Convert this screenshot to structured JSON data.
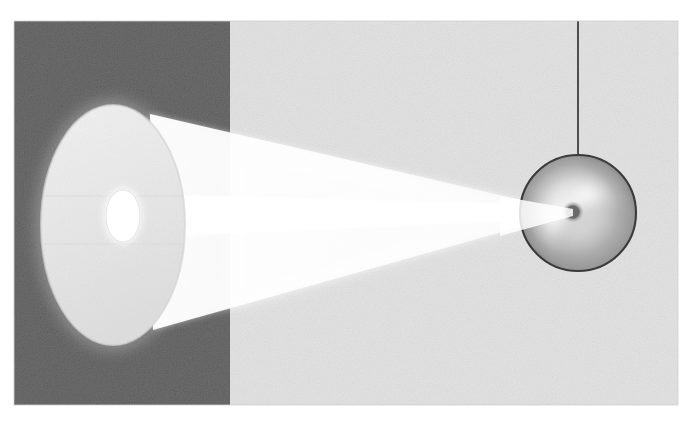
{
  "figure": {
    "medium": "halftone printed illustration, grayscale",
    "canvas": {
      "width": 693,
      "height": 421
    },
    "content_box": {
      "x": 14,
      "y": 21,
      "width": 664,
      "height": 384
    }
  },
  "palette": {
    "page_background": "#ffffff",
    "dark_panel": "#6e6e6e",
    "light_panel": "#e3e3e3",
    "beam_light": "#fbfbfb",
    "beam_inner": "#ffffff",
    "lens_face": "#ededed",
    "source_highlight": "#ffffff",
    "sphere_outline": "#3a3a3a",
    "sphere_shadow": "#9a9a9a",
    "sphere_glow": "#ffffff",
    "focal_spot": "#6a6a6a",
    "string": "#2b2b2b"
  },
  "regions": {
    "dark_panel": {
      "label": "dark background panel",
      "x": 14,
      "y": 21,
      "width": 216,
      "height": 384,
      "fill": "#6e6e6e"
    },
    "light_panel": {
      "label": "light background panel",
      "x": 230,
      "y": 21,
      "width": 448,
      "height": 384,
      "fill": "#e3e3e3"
    }
  },
  "elements": {
    "reflector": {
      "label": "reflector / lens face ellipse",
      "cx": 113,
      "cy": 225,
      "rx": 72,
      "ry": 120,
      "fill": "#ededed"
    },
    "light_source": {
      "label": "lamp filament highlight",
      "cx": 123,
      "cy": 216,
      "rx": 17,
      "ry": 26,
      "fill": "#ffffff"
    },
    "beam_cone": {
      "label": "converging light beam",
      "apex_x": 573,
      "apex_y": 212,
      "top_start_x": 150,
      "top_start_y": 114,
      "bottom_start_x": 153,
      "bottom_start_y": 330,
      "fill": "#fbfbfb"
    },
    "beam_core": {
      "label": "inner bright axial beam",
      "start_x": 123,
      "start_y": 216,
      "apex_x": 573,
      "apex_y": 212,
      "half_height": 22,
      "fill": "#ffffff"
    },
    "sphere": {
      "label": "suspended spherical target",
      "cx": 578,
      "cy": 213,
      "r": 58,
      "outline": "#3a3a3a"
    },
    "focal_spot": {
      "label": "focal hot spot on sphere",
      "cx": 573,
      "cy": 212,
      "r": 9,
      "fill": "#6a6a6a"
    },
    "string": {
      "label": "suspension string",
      "x": 578,
      "y_top": 21,
      "y_bottom": 158,
      "stroke": "#2b2b2b",
      "stroke_width": 1.6
    }
  },
  "annotations": {
    "figure_caption": "",
    "labels": []
  }
}
